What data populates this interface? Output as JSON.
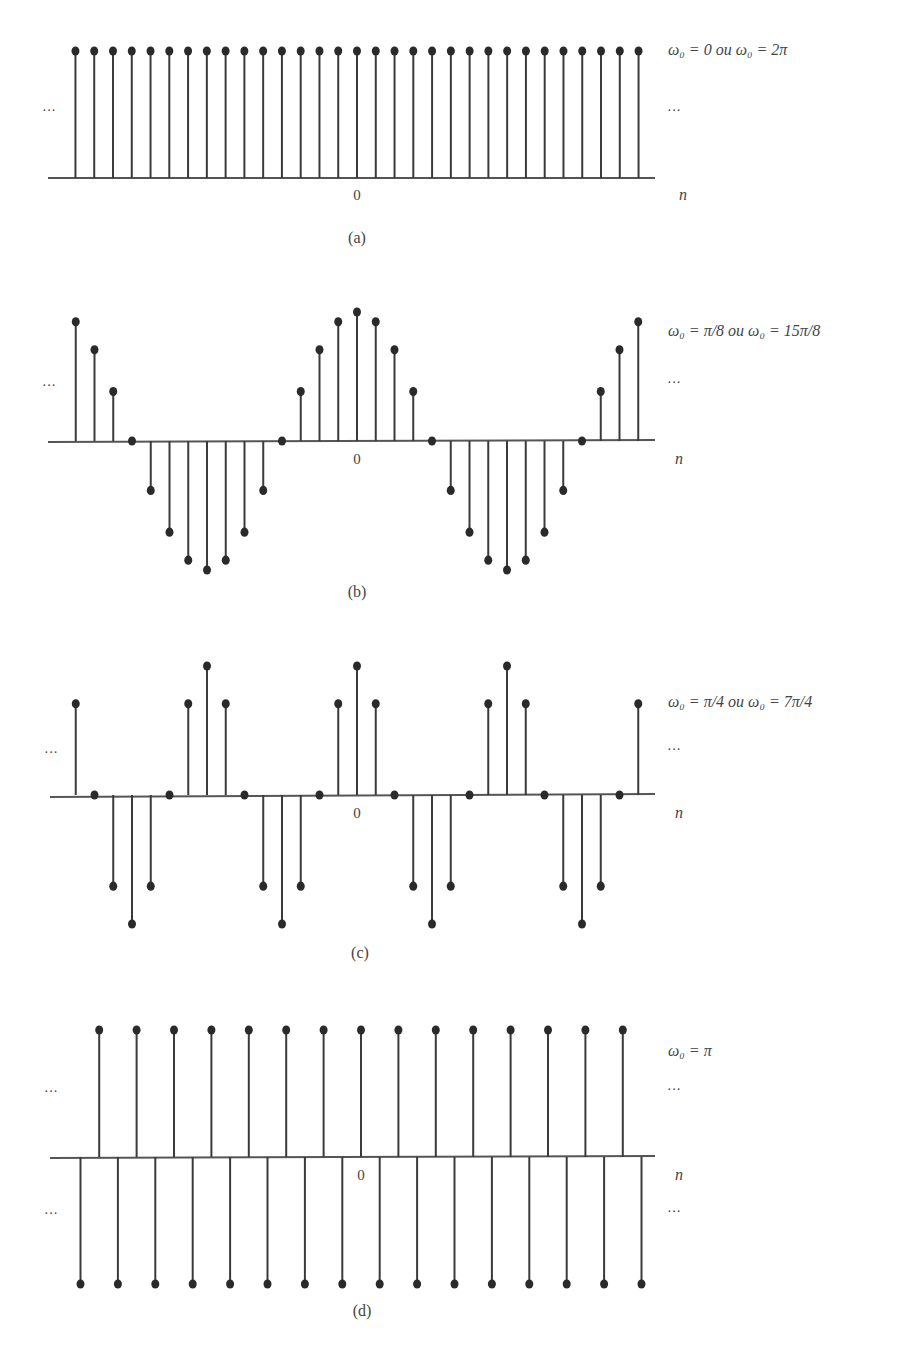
{
  "figure": {
    "panels": [
      {
        "id": "a",
        "caption": "(a)",
        "formula": "ω₀ = 0 ou ω₀ = 2π",
        "origin_label": "0",
        "axis_label": "n",
        "ellipsis": "···"
      },
      {
        "id": "b",
        "caption": "(b)",
        "formula": "ω₀ = π/8 ou ω₀ = 15π/8",
        "origin_label": "0",
        "axis_label": "n",
        "ellipsis": "···"
      },
      {
        "id": "c",
        "caption": "(c)",
        "formula": "ω₀ = π/4 ou ω₀ = 7π/4",
        "origin_label": "0",
        "axis_label": "n",
        "ellipsis": "···"
      },
      {
        "id": "d",
        "caption": "(d)",
        "formula": "ω₀ = π",
        "origin_label": "0",
        "axis_label": "n",
        "ellipsis": "···"
      }
    ]
  },
  "chart_data": [
    {
      "type": "stem",
      "title": "ω₀ = 0 ou ω₀ = 2π",
      "caption": "(a)",
      "xlabel": "n",
      "x_tick_labels": [
        "0"
      ],
      "x": [
        -15,
        -14,
        -13,
        -12,
        -11,
        -10,
        -9,
        -8,
        -7,
        -6,
        -5,
        -4,
        -3,
        -2,
        -1,
        0,
        1,
        2,
        3,
        4,
        5,
        6,
        7,
        8,
        9,
        10,
        11,
        12,
        13,
        14,
        15
      ],
      "values": [
        1,
        1,
        1,
        1,
        1,
        1,
        1,
        1,
        1,
        1,
        1,
        1,
        1,
        1,
        1,
        1,
        1,
        1,
        1,
        1,
        1,
        1,
        1,
        1,
        1,
        1,
        1,
        1,
        1,
        1,
        1
      ],
      "expression": "cos(0·n)",
      "ylim": [
        -1,
        1
      ],
      "grid": false,
      "continuation_marks": "··· on both sides"
    },
    {
      "type": "stem",
      "title": "ω₀ = π/8 ou ω₀ = 15π/8",
      "caption": "(b)",
      "xlabel": "n",
      "x_tick_labels": [
        "0"
      ],
      "x": [
        -15,
        -14,
        -13,
        -12,
        -11,
        -10,
        -9,
        -8,
        -7,
        -6,
        -5,
        -4,
        -3,
        -2,
        -1,
        0,
        1,
        2,
        3,
        4,
        5,
        6,
        7,
        8,
        9,
        10,
        11,
        12,
        13,
        14,
        15
      ],
      "values": [
        0.924,
        0.707,
        0.383,
        0,
        -0.383,
        -0.707,
        -0.924,
        -1,
        -0.924,
        -0.707,
        -0.383,
        0,
        0.383,
        0.707,
        0.924,
        1,
        0.924,
        0.707,
        0.383,
        0,
        -0.383,
        -0.707,
        -0.924,
        -1,
        -0.924,
        -0.707,
        -0.383,
        0,
        0.383,
        0.707,
        0.924
      ],
      "expression": "cos(πn/8)",
      "ylim": [
        -1,
        1
      ],
      "grid": false,
      "continuation_marks": "··· on both sides"
    },
    {
      "type": "stem",
      "title": "ω₀ = π/4 ou ω₀ = 7π/4",
      "caption": "(c)",
      "xlabel": "n",
      "x_tick_labels": [
        "0"
      ],
      "x": [
        -15,
        -14,
        -13,
        -12,
        -11,
        -10,
        -9,
        -8,
        -7,
        -6,
        -5,
        -4,
        -3,
        -2,
        -1,
        0,
        1,
        2,
        3,
        4,
        5,
        6,
        7,
        8,
        9,
        10,
        11,
        12,
        13,
        14,
        15
      ],
      "values": [
        0.707,
        0,
        -0.707,
        -1,
        -0.707,
        0,
        0.707,
        1,
        0.707,
        0,
        -0.707,
        -1,
        -0.707,
        0,
        0.707,
        1,
        0.707,
        0,
        -0.707,
        -1,
        -0.707,
        0,
        0.707,
        1,
        0.707,
        0,
        -0.707,
        -1,
        -0.707,
        0,
        0.707
      ],
      "expression": "cos(πn/4)",
      "ylim": [
        -1,
        1
      ],
      "grid": false,
      "continuation_marks": "··· on both sides"
    },
    {
      "type": "stem",
      "title": "ω₀ = π",
      "caption": "(d)",
      "xlabel": "n",
      "x_tick_labels": [
        "0"
      ],
      "x": [
        -15,
        -14,
        -13,
        -12,
        -11,
        -10,
        -9,
        -8,
        -7,
        -6,
        -5,
        -4,
        -3,
        -2,
        -1,
        0,
        1,
        2,
        3,
        4,
        5,
        6,
        7,
        8,
        9,
        10,
        11,
        12,
        13,
        14,
        15
      ],
      "values": [
        -1,
        1,
        -1,
        1,
        -1,
        1,
        -1,
        1,
        -1,
        1,
        -1,
        1,
        -1,
        1,
        -1,
        1,
        -1,
        1,
        -1,
        1,
        -1,
        1,
        -1,
        1,
        -1,
        1,
        -1,
        1,
        -1,
        1,
        -1
      ],
      "expression": "cos(πn)",
      "ylim": [
        -1,
        1
      ],
      "grid": false,
      "continuation_marks": "··· above and below on both sides"
    }
  ]
}
